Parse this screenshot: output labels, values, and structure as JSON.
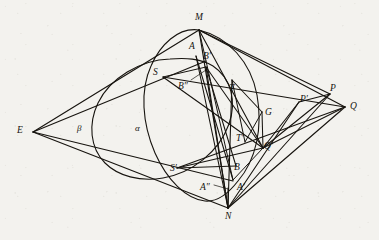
{
  "figure": {
    "kind": "geometry-diagram",
    "background_color": "#f3f2ee",
    "ink_color": "#17140f",
    "width": 379,
    "height": 240,
    "conics": [
      {
        "name": "alpha",
        "label": "α",
        "label_x": 135,
        "label_y": 124
      },
      {
        "name": "beta",
        "label": "β",
        "label_x": 77,
        "label_y": 124
      }
    ],
    "labels": [
      {
        "id": "M",
        "text": "M",
        "x": 195,
        "y": 13,
        "point_x": 199,
        "point_y": 30
      },
      {
        "id": "A",
        "text": "A",
        "x": 189,
        "y": 42,
        "point_x": 196,
        "point_y": 56
      },
      {
        "id": "Bp",
        "text": "B′",
        "x": 203,
        "y": 52,
        "point_x": 206,
        "point_y": 67
      },
      {
        "id": "S",
        "text": "S",
        "x": 153,
        "y": 68,
        "point_x": 163,
        "point_y": 77
      },
      {
        "id": "Bpp",
        "text": "B″",
        "x": 178,
        "y": 82,
        "point_x": 206,
        "point_y": 70
      },
      {
        "id": "T",
        "text": "T",
        "x": 229,
        "y": 84,
        "point_x": 232,
        "point_y": 80
      },
      {
        "id": "G",
        "text": "G",
        "x": 265,
        "y": 108,
        "point_x": 262,
        "point_y": 112
      },
      {
        "id": "Pp",
        "text": "P′",
        "x": 300,
        "y": 95,
        "point_x": 299,
        "point_y": 102
      },
      {
        "id": "P",
        "text": "P",
        "x": 330,
        "y": 84,
        "point_x": 330,
        "point_y": 94
      },
      {
        "id": "Q",
        "text": "Q",
        "x": 350,
        "y": 102,
        "point_x": 345,
        "point_y": 107
      },
      {
        "id": "Tp",
        "text": "T′",
        "x": 236,
        "y": 134,
        "point_x": 245,
        "point_y": 142
      },
      {
        "id": "Qp",
        "text": "Q′",
        "x": 264,
        "y": 142,
        "point_x": 263,
        "point_y": 148
      },
      {
        "id": "B",
        "text": "B",
        "x": 234,
        "y": 163,
        "point_x": 236,
        "point_y": 166
      },
      {
        "id": "Sp",
        "text": "S′",
        "x": 170,
        "y": 164,
        "point_x": 177,
        "point_y": 168
      },
      {
        "id": "App",
        "text": "A″",
        "x": 200,
        "y": 183,
        "point_x": 228,
        "point_y": 188
      },
      {
        "id": "Ap",
        "text": "A′",
        "x": 237,
        "y": 183,
        "point_x": 233,
        "point_y": 180
      },
      {
        "id": "N",
        "text": "N",
        "x": 225,
        "y": 212,
        "point_x": 228,
        "point_y": 208
      },
      {
        "id": "E",
        "text": "E",
        "x": 17,
        "y": 126,
        "point_x": 33,
        "point_y": 132
      }
    ],
    "vertices": {
      "E": [
        33,
        132
      ],
      "M": [
        199,
        30
      ],
      "N": [
        228,
        208
      ],
      "Q": [
        345,
        107
      ],
      "P": [
        330,
        94
      ],
      "Pprime": [
        299,
        102
      ],
      "Qprime": [
        263,
        148
      ],
      "G": [
        262,
        112
      ],
      "S": [
        163,
        77
      ],
      "Sprime": [
        177,
        168
      ],
      "T": [
        232,
        80
      ],
      "Tprime": [
        245,
        142
      ],
      "A": [
        196,
        56
      ],
      "Aprime": [
        233,
        180
      ],
      "Adprime": [
        228,
        188
      ],
      "B": [
        236,
        166
      ],
      "Bprime": [
        206,
        67
      ],
      "Bdprime": [
        206,
        70
      ]
    }
  }
}
